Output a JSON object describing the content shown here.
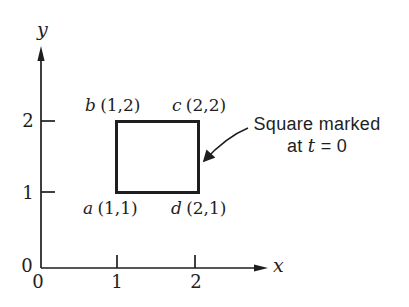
{
  "figure": {
    "colors": {
      "background": "#ffffff",
      "ink": "#1e1e1e"
    },
    "axes": {
      "y_label": "y",
      "x_label": "x",
      "y_tick_2": "2",
      "y_tick_1": "1",
      "y_origin": "0",
      "x_origin": "0",
      "x_tick_1": "1",
      "x_tick_2": "2"
    },
    "square": {
      "vertices": {
        "b": {
          "letter": "b",
          "coords": "(1,2)"
        },
        "c": {
          "letter": "c",
          "coords": "(2,2)"
        },
        "a": {
          "letter": "a",
          "coords": "(1,1)"
        },
        "d": {
          "letter": "d",
          "coords": "(2,1)"
        }
      }
    },
    "annotation": {
      "line1": "Square marked",
      "line2_prefix": "at ",
      "line2_var": "t",
      "line2_suffix": " = 0"
    }
  }
}
